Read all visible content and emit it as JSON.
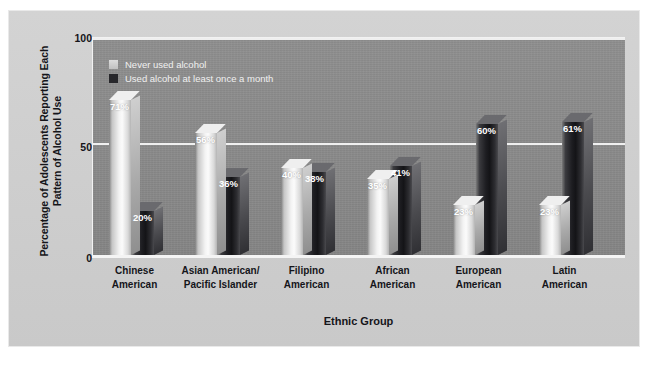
{
  "figure": {
    "background_color": "#cfcfcf",
    "plot_background_color": "#8a8a8a"
  },
  "chart_data": {
    "type": "bar",
    "title": "",
    "xlabel": "Ethnic Group",
    "ylabel": "Percentage of Adolescents Reporting Each Pattern of Alcohol Use",
    "ylim": [
      0,
      100
    ],
    "yticks": [
      "0",
      "50",
      "100"
    ],
    "grid": true,
    "legend_position": "top-left inside plot",
    "categories": [
      "Chinese American",
      "Asian American/ Pacific Islander",
      "Filipino American",
      "African American",
      "European American",
      "Latin American"
    ],
    "category_lines": [
      [
        "Chinese",
        "American"
      ],
      [
        "Asian American/",
        "Pacific Islander"
      ],
      [
        "Filipino",
        "American"
      ],
      [
        "African",
        "American"
      ],
      [
        "European",
        "American"
      ],
      [
        "Latin",
        "American"
      ]
    ],
    "series": [
      {
        "name": "Never used alcohol",
        "color": "#ededed",
        "values": [
          71,
          56,
          40,
          35,
          23,
          23
        ],
        "labels": [
          "71%",
          "56%",
          "40%",
          "35%",
          "23%",
          "23%"
        ]
      },
      {
        "name": "Used alcohol at least once a month",
        "color": "#1d1d21",
        "values": [
          20,
          36,
          38,
          41,
          60,
          61
        ],
        "labels": [
          "20%",
          "36%",
          "38%",
          "41%",
          "60%",
          "61%"
        ]
      }
    ]
  },
  "legend": {
    "items": [
      {
        "label": "Never used alcohol",
        "swatch": "light-swatch-icon"
      },
      {
        "label": "Used alcohol at least once a month",
        "swatch": "dark-swatch-icon"
      }
    ]
  },
  "axes": {
    "y_title": "Percentage of Adolescents Reporting Each Pattern of Alcohol Use",
    "x_title": "Ethnic Group",
    "y_ticks": [
      {
        "value": "100"
      },
      {
        "value": "50"
      },
      {
        "value": "0"
      }
    ]
  }
}
